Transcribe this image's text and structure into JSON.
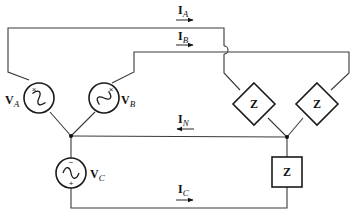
{
  "diagram": {
    "type": "three-phase-wye-wye-circuit",
    "sources": [
      {
        "id": "VA",
        "label": "V",
        "subscript": "A",
        "polarity_mark": "×"
      },
      {
        "id": "VB",
        "label": "V",
        "subscript": "B",
        "polarity_mark": "×"
      },
      {
        "id": "VC",
        "label": "V",
        "subscript": "C",
        "minus_mark": "−",
        "plus_mark": "+"
      }
    ],
    "loads": [
      {
        "id": "ZA",
        "label": "Z",
        "shape": "diamond"
      },
      {
        "id": "ZB",
        "label": "Z",
        "shape": "diamond"
      },
      {
        "id": "ZC",
        "label": "Z",
        "shape": "square"
      }
    ],
    "currents": [
      {
        "id": "IA",
        "label": "I",
        "subscript": "A",
        "direction": "right"
      },
      {
        "id": "IB",
        "label": "I",
        "subscript": "B",
        "direction": "right"
      },
      {
        "id": "IN",
        "label": "I",
        "subscript": "N",
        "direction": "left"
      },
      {
        "id": "IC",
        "label": "I",
        "subscript": "C",
        "direction": "right"
      }
    ],
    "colors": {
      "wire": "#3a3a3a",
      "component": "#1a1a1a",
      "background": "#ffffff"
    }
  }
}
